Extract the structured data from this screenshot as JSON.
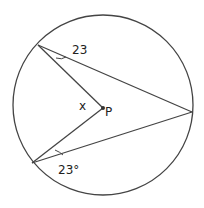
{
  "diagram": {
    "circle": {
      "cx": 103,
      "cy": 105,
      "r": 90
    },
    "points": {
      "A": {
        "x": 38,
        "y": 45
      },
      "B": {
        "x": 192,
        "y": 112
      },
      "C": {
        "x": 32,
        "y": 163
      },
      "P": {
        "x": 103,
        "y": 108
      }
    },
    "labels": {
      "angle_top": "23",
      "angle_bottom": "23°",
      "x": "x",
      "center": "P"
    },
    "colors": {
      "stroke": "#444444",
      "text": "#222222"
    }
  }
}
